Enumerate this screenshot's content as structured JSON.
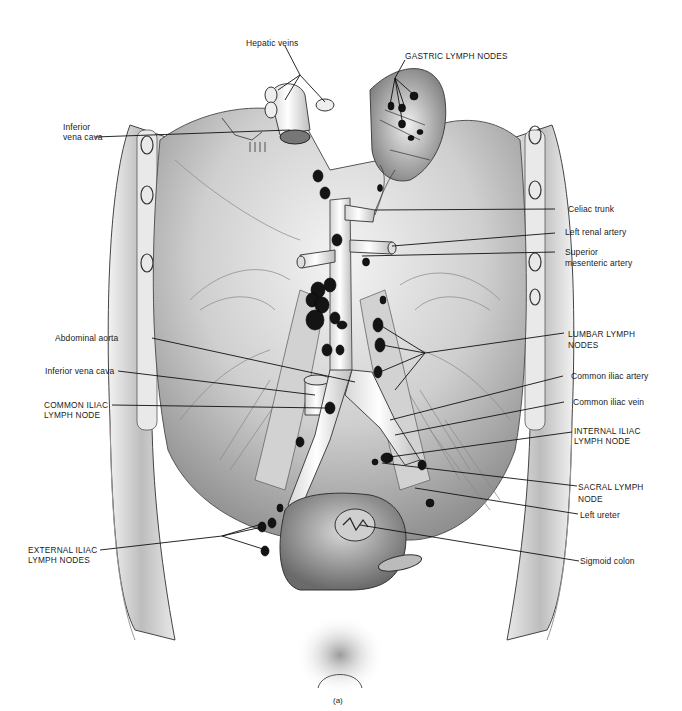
{
  "figure": {
    "type": "anatomical-illustration",
    "caption": "(a)",
    "colors": {
      "background": "#ffffff",
      "ink": "#111111",
      "tissue_light": "#e6e6e6",
      "tissue_mid": "#b5b5b5",
      "tissue_dark": "#6e6e6e",
      "node_fill": "#141414"
    }
  },
  "labels": {
    "hepatic_veins": "Hepatic veins",
    "gastric_lymph_nodes": "GASTRIC LYMPH NODES",
    "inferior_vena_cava_top_1": "Inferior",
    "inferior_vena_cava_top_2": "vena cava",
    "celiac_trunk": "Celiac trunk",
    "left_renal_artery": "Left renal artery",
    "superior_mesenteric_artery_1": "Superior",
    "superior_mesenteric_artery_2": "mesenteric artery",
    "abdominal_aorta": "Abdominal aorta",
    "lumbar_lymph_nodes_1": "LUMBAR LYMPH",
    "lumbar_lymph_nodes_2": "NODES",
    "inferior_vena_cava_mid": "Inferior vena cava",
    "common_iliac_artery": "Common iliac artery",
    "common_iliac_lymph_node_1": "COMMON ILIAC",
    "common_iliac_lymph_node_2": "LYMPH NODE",
    "common_iliac_vein": "Common iliac vein",
    "internal_iliac_lymph_node_1": "INTERNAL ILIAC",
    "internal_iliac_lymph_node_2": "LYMPH NODE",
    "sacral_lymph_node_1": "SACRAL LYMPH",
    "sacral_lymph_node_2": "NODE",
    "left_ureter": "Left ureter",
    "external_iliac_lymph_nodes_1": "EXTERNAL ILIAC",
    "external_iliac_lymph_nodes_2": "LYMPH NODES",
    "sigmoid_colon": "Sigmoid colon"
  }
}
